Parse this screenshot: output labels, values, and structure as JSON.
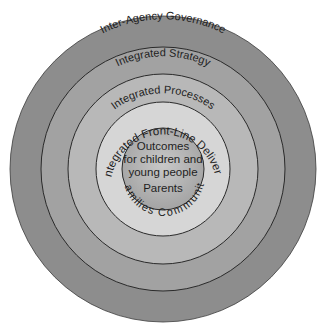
{
  "diagram": {
    "type": "concentric-circles",
    "center": {
      "x": 163,
      "y": 169
    },
    "rings": [
      {
        "id": "governance",
        "label": "Inter-Agency Governance",
        "radius": 153,
        "fill": "#8d8d8d",
        "label_radius": 135
      },
      {
        "id": "strategy",
        "label": "Integrated Strategy",
        "radius": 122,
        "fill": "#a2a2a2",
        "label_radius": 106
      },
      {
        "id": "processes",
        "label": "Integrated Processes",
        "radius": 95,
        "fill": "#b8b8b8",
        "label_radius": 80
      },
      {
        "id": "delivery",
        "label": "Integrated Front-Line Delivery",
        "radius": 67,
        "fill": "#d6d6d6",
        "label_radius": 53
      }
    ],
    "core": {
      "radius": 41,
      "fill": "#b2b2b2",
      "lines": [
        "Outcomes",
        "for children and",
        "young people"
      ],
      "parents": "Parents",
      "arc_label": "Families Community"
    },
    "stroke_color": "#333333"
  }
}
